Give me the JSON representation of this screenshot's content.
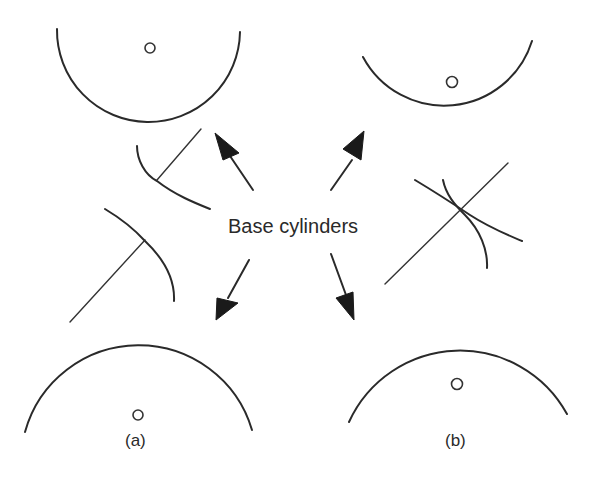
{
  "figure": {
    "callout_label": "Base cylinders",
    "panels": [
      {
        "id": "a",
        "caption": "(a)",
        "description": "Involute tooth profiles with base cylinders separated"
      },
      {
        "id": "b",
        "caption": "(b)",
        "description": "Involute tooth profiles crossing between base cylinders"
      }
    ]
  },
  "colors": {
    "line": "#2a2a2a",
    "arrow": "#1a1a1a",
    "background": "#ffffff"
  }
}
